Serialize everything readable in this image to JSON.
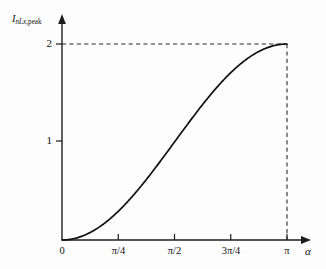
{
  "figure": {
    "background_color": "#fdfdfd",
    "curve_color": "#111111",
    "axis_color": "#1c1c1c",
    "dash_color": "#2a2a2a"
  },
  "axes": {
    "y_label_main": "I",
    "y_label_sub_italic": "nLx,",
    "y_label_sub_roman": "peak",
    "x_label": "α"
  },
  "ticks": {
    "y": [
      {
        "label": "1",
        "value": 1
      },
      {
        "label": "2",
        "value": 2
      }
    ],
    "x": [
      {
        "label": "0",
        "value": 0
      },
      {
        "label": "π/4",
        "value": 0.7853981634
      },
      {
        "label": "π/2",
        "value": 1.5707963268
      },
      {
        "label": "3π/4",
        "value": 2.3561944902
      },
      {
        "label": "π",
        "value": 3.1415926536
      }
    ]
  },
  "annotations": {
    "horizontal_dash_at_y": 2,
    "vertical_dash_at_x": "π"
  },
  "chart_data": {
    "type": "line",
    "title": "",
    "xlabel": "α",
    "ylabel": "I_nLx,peak",
    "xlim": [
      0,
      3.1415926536
    ],
    "ylim": [
      0,
      2.18
    ],
    "grid": false,
    "legend": null,
    "xtick_labels": [
      "0",
      "π/4",
      "π/2",
      "3π/4",
      "π"
    ],
    "xtick_values": [
      0,
      0.7853981634,
      1.5707963268,
      2.3561944902,
      3.1415926536
    ],
    "ytick_labels": [
      "1",
      "2"
    ],
    "ytick_values": [
      1,
      2
    ],
    "formula": "1 - cos(alpha)",
    "series": [
      {
        "name": "I_nLx,peak",
        "x": [
          0.0,
          0.15708,
          0.31416,
          0.47124,
          0.62832,
          0.7854,
          0.94248,
          1.09956,
          1.25664,
          1.41372,
          1.5708,
          1.72788,
          1.88496,
          2.04204,
          2.19911,
          2.35619,
          2.51327,
          2.67035,
          2.82743,
          2.98451,
          3.14159
        ],
        "y": [
          0.0,
          0.01231,
          0.04894,
          0.10899,
          0.19098,
          0.29289,
          0.41221,
          0.54601,
          0.69098,
          0.84357,
          1.0,
          1.15643,
          1.30902,
          1.45399,
          1.58779,
          1.70711,
          1.80902,
          1.89101,
          1.95106,
          1.98769,
          2.0
        ]
      }
    ],
    "annotations": [
      {
        "type": "dashed-hline",
        "y": 2,
        "from_x": 0,
        "to_x": 3.1415926536
      },
      {
        "type": "dashed-vline",
        "x": 3.1415926536,
        "from_y": 0,
        "to_y": 2
      }
    ]
  }
}
